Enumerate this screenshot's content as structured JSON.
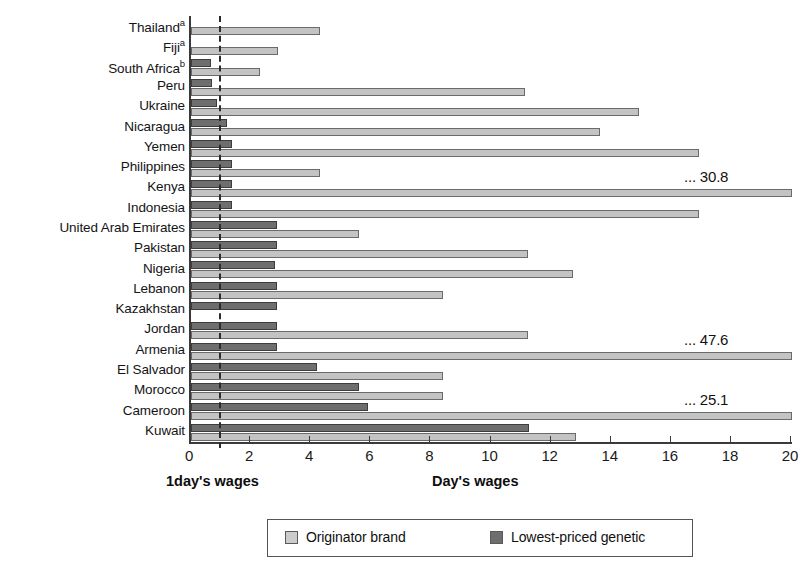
{
  "chart_data": {
    "type": "bar",
    "orientation": "horizontal",
    "title": "",
    "xlabel": "Day's wages",
    "ylabel": "",
    "xlim": [
      0,
      20
    ],
    "xticks": [
      0,
      2,
      4,
      6,
      8,
      10,
      12,
      14,
      16,
      18,
      20
    ],
    "xtick_labels": [
      "0",
      "2",
      "4",
      "6",
      "8",
      "10",
      "12",
      "14",
      "16",
      "18",
      "20"
    ],
    "grid": false,
    "legend_position": "bottom",
    "reference_line": {
      "value": 1,
      "label": "1day's wages",
      "style": "dashed"
    },
    "categories": [
      "Thailand",
      "Fiji",
      "South Africa",
      "Peru",
      "Ukraine",
      "Nicaragua",
      "Yemen",
      "Philippines",
      "Kenya",
      "Indonesia",
      "United Arab Emirates",
      "Pakistan",
      "Nigeria",
      "Lebanon",
      "Kazakhstan",
      "Jordan",
      "Armenia",
      "El Salvador",
      "Morocco",
      "Cameroon",
      "Kuwait"
    ],
    "category_footnotes": [
      "a",
      "a",
      "b",
      "",
      "",
      "",
      "",
      "",
      "",
      "",
      "",
      "",
      "",
      "",
      "",
      "",
      "",
      "",
      "",
      "",
      ""
    ],
    "series": [
      {
        "name": "Originator brand",
        "color": "#c3c3c3",
        "values": [
          4.3,
          2.9,
          2.3,
          11.1,
          14.9,
          13.6,
          16.9,
          4.3,
          30.8,
          16.9,
          5.6,
          11.2,
          12.7,
          8.4,
          null,
          11.2,
          47.6,
          8.4,
          8.4,
          25.1,
          12.8
        ]
      },
      {
        "name": "Lowest-priced genetic",
        "color": "#6e6e6e",
        "values": [
          null,
          null,
          0.65,
          0.7,
          0.85,
          1.2,
          1.35,
          1.35,
          1.35,
          1.35,
          2.85,
          2.85,
          2.8,
          2.85,
          2.85,
          2.85,
          2.85,
          4.2,
          5.6,
          5.9,
          11.25
        ]
      }
    ],
    "overflow_annotations": [
      {
        "category": "Kenya",
        "series": "Originator brand",
        "label": "... 30.8"
      },
      {
        "category": "Armenia",
        "series": "Originator brand",
        "label": "... 47.6"
      },
      {
        "category": "Cameroon",
        "series": "Originator brand",
        "label": "... 25.1"
      }
    ]
  },
  "axis": {
    "x_caption": "Day's wages",
    "reference_caption": "1day's wages"
  },
  "legend": {
    "items": [
      {
        "label": "Originator brand",
        "swatch": "light"
      },
      {
        "label": "Lowest-priced genetic",
        "swatch": "dark"
      }
    ]
  }
}
